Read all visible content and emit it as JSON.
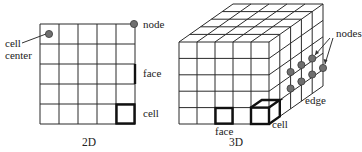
{
  "colors": {
    "line": "#2a2a2a",
    "thick_line": "#111111",
    "node_fill": "#6f6f6f",
    "background": "#ffffff"
  },
  "panel_2d": {
    "caption": "2D",
    "grid": {
      "rows": 5,
      "cols": 5
    },
    "labels": {
      "cell_center_line1": "cell",
      "cell_center_line2": "center",
      "node": "node",
      "face": "face",
      "cell": "cell"
    }
  },
  "panel_3d": {
    "caption": "3D",
    "grid": {
      "rows": 5,
      "cols": 5,
      "depth": 5
    },
    "node_count": 7,
    "labels": {
      "nodes": "nodes",
      "edge": "edge",
      "face": "face",
      "cell": "cell"
    }
  }
}
